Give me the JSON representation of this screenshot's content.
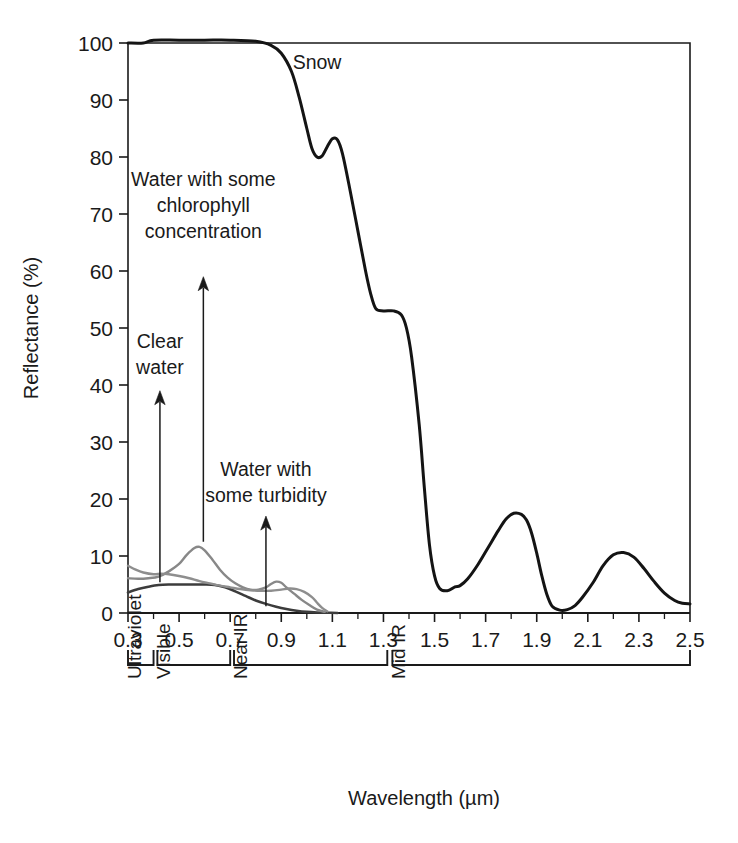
{
  "chart_data": {
    "type": "line",
    "title": "",
    "xlabel": "Wavelength (µm)",
    "ylabel": "Reflectance (%)",
    "xlim": [
      0.3,
      2.5
    ],
    "ylim": [
      0,
      100
    ],
    "grid": false,
    "legend_position": "none",
    "xticks": [
      "0.3",
      "0.5",
      "0.7",
      "0.9",
      "1.1",
      "1.3",
      "1.5",
      "1.7",
      "1.9",
      "2.1",
      "2.3",
      "2.5"
    ],
    "xtick_values": [
      0.3,
      0.5,
      0.7,
      0.9,
      1.1,
      1.3,
      1.5,
      1.7,
      1.9,
      2.1,
      2.3,
      2.5
    ],
    "xtick_minor": [
      0.4,
      0.6,
      0.8,
      1.0,
      1.2,
      1.4,
      1.6,
      1.8,
      2.0,
      2.2,
      2.4
    ],
    "yticks": [
      "0",
      "10",
      "20",
      "30",
      "40",
      "50",
      "60",
      "70",
      "80",
      "90",
      "100"
    ],
    "ytick_values": [
      0,
      10,
      20,
      30,
      40,
      50,
      60,
      70,
      80,
      90,
      100
    ],
    "series": [
      {
        "name": "Snow",
        "color": "#141414",
        "width": 3.0,
        "points": [
          [
            0.3,
            100
          ],
          [
            0.36,
            100
          ],
          [
            0.4,
            100.5
          ],
          [
            0.5,
            100.5
          ],
          [
            0.6,
            100.5
          ],
          [
            0.7,
            100.5
          ],
          [
            0.8,
            100.3
          ],
          [
            0.86,
            99.6
          ],
          [
            0.9,
            98.2
          ],
          [
            0.94,
            95.0
          ],
          [
            0.97,
            90.5
          ],
          [
            1.0,
            85.0
          ],
          [
            1.02,
            81.5
          ],
          [
            1.04,
            80.0
          ],
          [
            1.06,
            80.2
          ],
          [
            1.08,
            81.8
          ],
          [
            1.1,
            83.2
          ],
          [
            1.12,
            83.0
          ],
          [
            1.14,
            80.5
          ],
          [
            1.17,
            74.0
          ],
          [
            1.2,
            67.0
          ],
          [
            1.23,
            60.0
          ],
          [
            1.25,
            56.0
          ],
          [
            1.27,
            53.4
          ],
          [
            1.3,
            53.0
          ],
          [
            1.34,
            53.0
          ],
          [
            1.37,
            52.3
          ],
          [
            1.39,
            50.0
          ],
          [
            1.41,
            45.0
          ],
          [
            1.44,
            33.0
          ],
          [
            1.46,
            22.0
          ],
          [
            1.48,
            12.0
          ],
          [
            1.5,
            6.5
          ],
          [
            1.52,
            4.3
          ],
          [
            1.55,
            3.9
          ],
          [
            1.58,
            4.6
          ],
          [
            1.6,
            4.8
          ],
          [
            1.63,
            6.0
          ],
          [
            1.67,
            8.5
          ],
          [
            1.71,
            11.5
          ],
          [
            1.75,
            14.5
          ],
          [
            1.78,
            16.5
          ],
          [
            1.81,
            17.5
          ],
          [
            1.84,
            17.3
          ],
          [
            1.86,
            16.3
          ],
          [
            1.88,
            14.0
          ],
          [
            1.9,
            10.5
          ],
          [
            1.92,
            6.5
          ],
          [
            1.94,
            3.2
          ],
          [
            1.96,
            1.2
          ],
          [
            1.99,
            0.5
          ],
          [
            2.02,
            0.6
          ],
          [
            2.05,
            1.3
          ],
          [
            2.08,
            2.8
          ],
          [
            2.12,
            5.3
          ],
          [
            2.16,
            8.3
          ],
          [
            2.2,
            10.2
          ],
          [
            2.24,
            10.6
          ],
          [
            2.28,
            9.8
          ],
          [
            2.32,
            7.8
          ],
          [
            2.36,
            5.5
          ],
          [
            2.4,
            3.5
          ],
          [
            2.44,
            2.2
          ],
          [
            2.47,
            1.7
          ],
          [
            2.5,
            1.6
          ]
        ]
      },
      {
        "name": "Clear water",
        "color": "#3c3c3c",
        "width": 2.6,
        "points": [
          [
            0.3,
            3.6
          ],
          [
            0.34,
            4.2
          ],
          [
            0.38,
            4.6
          ],
          [
            0.42,
            4.9
          ],
          [
            0.46,
            5.0
          ],
          [
            0.5,
            5.0
          ],
          [
            0.55,
            5.0
          ],
          [
            0.6,
            5.0
          ],
          [
            0.64,
            4.9
          ],
          [
            0.68,
            4.5
          ],
          [
            0.72,
            3.8
          ],
          [
            0.76,
            3.0
          ],
          [
            0.8,
            2.2
          ],
          [
            0.84,
            1.6
          ],
          [
            0.88,
            1.1
          ],
          [
            0.92,
            0.7
          ],
          [
            0.96,
            0.4
          ],
          [
            1.0,
            0.2
          ],
          [
            1.04,
            0.1
          ],
          [
            1.08,
            0.05
          ],
          [
            1.12,
            0.0
          ]
        ]
      },
      {
        "name": "Water with some chlorophyll concentration",
        "color": "#888888",
        "width": 2.4,
        "points": [
          [
            0.3,
            6.1
          ],
          [
            0.34,
            6.0
          ],
          [
            0.38,
            6.1
          ],
          [
            0.42,
            6.4
          ],
          [
            0.46,
            7.3
          ],
          [
            0.5,
            8.6
          ],
          [
            0.53,
            10.2
          ],
          [
            0.56,
            11.4
          ],
          [
            0.58,
            11.6
          ],
          [
            0.6,
            11.0
          ],
          [
            0.63,
            9.4
          ],
          [
            0.66,
            7.6
          ],
          [
            0.69,
            6.2
          ],
          [
            0.72,
            5.2
          ],
          [
            0.75,
            4.5
          ],
          [
            0.78,
            4.1
          ],
          [
            0.81,
            4.1
          ],
          [
            0.84,
            4.5
          ],
          [
            0.86,
            5.1
          ],
          [
            0.88,
            5.5
          ],
          [
            0.9,
            5.3
          ],
          [
            0.92,
            4.5
          ],
          [
            0.95,
            3.4
          ],
          [
            0.98,
            2.3
          ],
          [
            1.01,
            1.4
          ],
          [
            1.04,
            0.6
          ],
          [
            1.07,
            0.2
          ]
        ]
      },
      {
        "name": "Water with some turbidity",
        "color": "#8e8e8e",
        "width": 2.4,
        "points": [
          [
            0.3,
            8.3
          ],
          [
            0.33,
            7.6
          ],
          [
            0.36,
            7.1
          ],
          [
            0.4,
            6.8
          ],
          [
            0.43,
            6.9
          ],
          [
            0.46,
            6.8
          ],
          [
            0.5,
            6.5
          ],
          [
            0.54,
            6.1
          ],
          [
            0.58,
            5.6
          ],
          [
            0.62,
            5.2
          ],
          [
            0.66,
            4.8
          ],
          [
            0.7,
            4.5
          ],
          [
            0.74,
            4.2
          ],
          [
            0.78,
            4.0
          ],
          [
            0.82,
            3.9
          ],
          [
            0.86,
            3.9
          ],
          [
            0.9,
            4.1
          ],
          [
            0.93,
            4.3
          ],
          [
            0.96,
            4.2
          ],
          [
            0.99,
            3.7
          ],
          [
            1.02,
            2.8
          ],
          [
            1.04,
            1.8
          ],
          [
            1.06,
            0.9
          ],
          [
            1.08,
            0.3
          ]
        ]
      }
    ],
    "annotations": [
      {
        "name": "snow",
        "label": "Snow",
        "lines": [
          "Snow"
        ],
        "x": 1.04,
        "y": 95.5,
        "arrow": false
      },
      {
        "name": "chlorophyll",
        "label": "Water with some chlorophyll concentration",
        "lines": [
          "Water with some",
          "chlorophyll",
          "concentration"
        ],
        "x": 0.595,
        "y": 75.0,
        "arrow": true,
        "arrow_from_y": 59.0,
        "arrow_to_y": 12.5
      },
      {
        "name": "clear-water",
        "label": "Clear water",
        "lines": [
          "Clear",
          "water"
        ],
        "x": 0.425,
        "y": 46.5,
        "arrow": true,
        "arrow_from_y": 39.0,
        "arrow_to_y": 5.4
      },
      {
        "name": "turbidity",
        "label": "Water with some turbidity",
        "lines": [
          "Water with",
          "some turbidity"
        ],
        "x": 0.84,
        "y": 24.0,
        "arrow": true,
        "arrow_from_y": 17.0,
        "arrow_to_y": 1.2
      }
    ],
    "bands": [
      {
        "name": "ultraviolet",
        "label": "Ultraviolet",
        "start": 0.3,
        "end": 0.4
      },
      {
        "name": "visible",
        "label": "Visible",
        "start": 0.415,
        "end": 0.7
      },
      {
        "name": "near-ir",
        "label": "Near IR",
        "start": 0.715,
        "end": 1.315
      },
      {
        "name": "mid-ir",
        "label": "Mid IR",
        "start": 1.335,
        "end": 2.5
      }
    ]
  },
  "colors": {
    "axis": "#1a1a1a",
    "snow": "#141414",
    "clear_water": "#3c3c3c",
    "chlorophyll": "#888888",
    "turbidity": "#8e8e8e",
    "background": "#ffffff"
  }
}
